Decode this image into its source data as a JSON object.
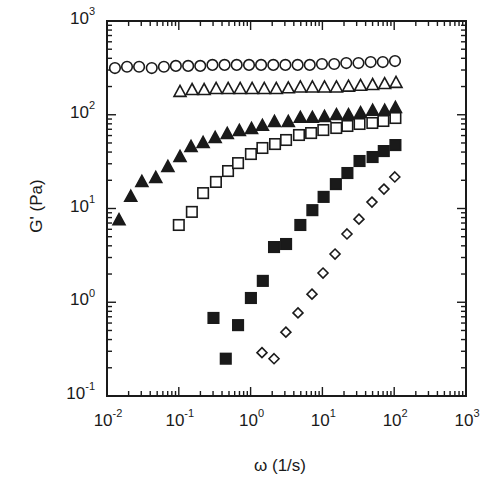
{
  "chart_data": {
    "type": "scatter",
    "title": "",
    "xlabel": "ω (1/s)",
    "ylabel": "G' (Pa)",
    "xscale": "log",
    "yscale": "log",
    "xlim": [
      0.01,
      1000
    ],
    "ylim": [
      0.1,
      1000
    ],
    "grid": false,
    "legend": null,
    "x_ticks": [
      {
        "base": "10",
        "exp": "-2",
        "value": 0.01
      },
      {
        "base": "10",
        "exp": "-1",
        "value": 0.1
      },
      {
        "base": "10",
        "exp": "0",
        "value": 1
      },
      {
        "base": "10",
        "exp": "1",
        "value": 10
      },
      {
        "base": "10",
        "exp": "2",
        "value": 100
      },
      {
        "base": "10",
        "exp": "3",
        "value": 1000
      }
    ],
    "y_ticks": [
      {
        "base": "10",
        "exp": "-1",
        "value": 0.1
      },
      {
        "base": "10",
        "exp": "0",
        "value": 1
      },
      {
        "base": "10",
        "exp": "1",
        "value": 10
      },
      {
        "base": "10",
        "exp": "2",
        "value": 100
      },
      {
        "base": "10",
        "exp": "3",
        "value": 1000
      }
    ],
    "series": [
      {
        "name": "open circles",
        "marker": "circle",
        "filled": false,
        "x": [
          0.0129,
          0.019,
          0.028,
          0.042,
          0.062,
          0.091,
          0.135,
          0.199,
          0.294,
          0.434,
          0.64,
          0.95,
          1.4,
          2.07,
          3.05,
          4.52,
          6.67,
          9.86,
          14.6,
          21.5,
          31.8,
          47,
          69.4,
          102.6
        ],
        "y": [
          315,
          325,
          325,
          315,
          325,
          332,
          332,
          332,
          340,
          340,
          340,
          340,
          340,
          340,
          340,
          340,
          340,
          348,
          348,
          356,
          356,
          365,
          365,
          374
        ]
      },
      {
        "name": "open triangles",
        "marker": "triangle",
        "filled": false,
        "x": [
          0.104,
          0.153,
          0.225,
          0.331,
          0.487,
          0.716,
          1.05,
          1.55,
          2.28,
          3.35,
          4.93,
          7.25,
          10.7,
          15.7,
          23.1,
          34.0,
          50.0,
          73.6,
          106
        ],
        "y": [
          175,
          183,
          183,
          188,
          188,
          188,
          188,
          188,
          188,
          191,
          195,
          195,
          195,
          195,
          199,
          203,
          207,
          212,
          218
        ]
      },
      {
        "name": "filled triangles",
        "marker": "triangle",
        "filled": true,
        "x": [
          0.0147,
          0.0214,
          0.0306,
          0.0478,
          0.0705,
          0.104,
          0.148,
          0.218,
          0.321,
          0.473,
          0.697,
          1.03,
          1.46,
          2.15,
          3.35,
          4.93,
          7.25,
          10.7,
          15.7,
          23.1,
          34.0,
          50.0,
          73.6,
          104
        ],
        "y": [
          7.5,
          13.3,
          19.2,
          21.1,
          27.7,
          35.4,
          45.3,
          50,
          56.5,
          62.4,
          67,
          70.5,
          76,
          83.7,
          83.7,
          92.5,
          92.5,
          94.7,
          99,
          99,
          104,
          110,
          110,
          118
        ]
      },
      {
        "name": "open squares",
        "marker": "square",
        "filled": false,
        "x": [
          0.1,
          0.152,
          0.218,
          0.329,
          0.485,
          0.669,
          1.01,
          1.46,
          2.19,
          3.12,
          4.72,
          6.96,
          10.3,
          15.6,
          22.3,
          32.9,
          49.6,
          70.7,
          104
        ],
        "y": [
          6.67,
          9.2,
          14.6,
          19.2,
          25.1,
          30.5,
          38.1,
          44.2,
          48.7,
          53.8,
          60.8,
          63.8,
          68.7,
          72.2,
          75.9,
          79.7,
          81.7,
          85.8,
          92.3
        ]
      },
      {
        "name": "filled squares",
        "marker": "square",
        "filled": true,
        "x": [
          0.304,
          0.451,
          0.669,
          1.01,
          1.48,
          2.12,
          3.12,
          4.93,
          7.25,
          10.4,
          15.4,
          22.3,
          32.9,
          50.0,
          71.6,
          104
        ],
        "y": [
          0.68,
          0.25,
          0.57,
          1.11,
          1.69,
          3.88,
          4.18,
          6.67,
          9.6,
          13.3,
          18.2,
          23.9,
          32.1,
          35.4,
          41,
          47.5
        ]
      },
      {
        "name": "open diamonds",
        "marker": "diamond",
        "filled": false,
        "x": [
          1.44,
          2.12,
          3.1,
          4.57,
          7.16,
          10.2,
          15,
          22,
          32.3,
          49,
          72,
          102
        ],
        "y": [
          0.29,
          0.25,
          0.48,
          0.77,
          1.22,
          2.05,
          3.27,
          5.35,
          7.7,
          11.7,
          16.1,
          21.7
        ]
      }
    ],
    "plot_area_px": {
      "left": 107,
      "top": 21,
      "right": 466,
      "bottom": 396
    },
    "colors": {
      "ink": "#1a1a1a",
      "background": "#ffffff"
    }
  }
}
